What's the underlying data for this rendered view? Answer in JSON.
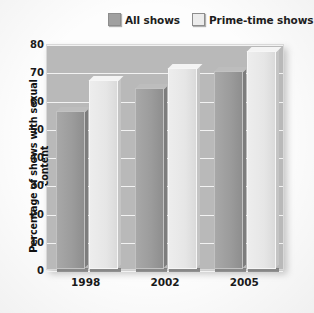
{
  "chart_data": {
    "type": "bar",
    "title": "",
    "subtitle": "",
    "xlabel": "",
    "ylabel": "Percentage of shows with sexual content",
    "categories": [
      "1998",
      "2002",
      "2005"
    ],
    "series": [
      {
        "name": "All shows",
        "color": "#9c9c9c",
        "values": [
          56,
          64,
          70
        ]
      },
      {
        "name": "Prime-time shows",
        "color": "#e8e8e8",
        "values": [
          67,
          71,
          77
        ]
      }
    ],
    "ylim": [
      0,
      80
    ],
    "yticks": [
      0,
      10,
      20,
      30,
      40,
      50,
      60,
      70,
      80
    ],
    "ytick_labels": [
      "0",
      "10",
      "20",
      "30",
      "40",
      "50",
      "60",
      "70",
      "80"
    ],
    "grid": true,
    "grid_color": "#f2f2f2",
    "legend_position": "top",
    "plot_background": "#b9b9b9",
    "figure_background": "#fdfdfd"
  },
  "legend": {
    "entries": [
      {
        "label": "All shows",
        "swatch": "legend-swatch-dark"
      },
      {
        "label": "Prime-time shows",
        "swatch": "legend-swatch-light"
      }
    ]
  }
}
